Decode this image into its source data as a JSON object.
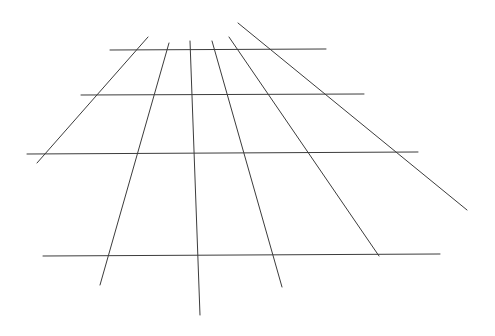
{
  "diagram": {
    "stroke_color": "#3c3c3c",
    "background": "#ffffff",
    "horizontal_lines": [
      {
        "x1": 110,
        "y1": 50,
        "x2": 326,
        "y2": 49
      },
      {
        "x1": 81,
        "y1": 95,
        "x2": 364,
        "y2": 94
      },
      {
        "x1": 27,
        "y1": 154,
        "x2": 418,
        "y2": 152
      },
      {
        "x1": 43,
        "y1": 256,
        "x2": 440,
        "y2": 254
      }
    ],
    "converging_lines": [
      {
        "x1": 148,
        "y1": 37,
        "x2": 37,
        "y2": 163
      },
      {
        "x1": 169,
        "y1": 43,
        "x2": 100,
        "y2": 285
      },
      {
        "x1": 190,
        "y1": 41,
        "x2": 200,
        "y2": 315
      },
      {
        "x1": 212,
        "y1": 41,
        "x2": 282,
        "y2": 287
      },
      {
        "x1": 229,
        "y1": 37,
        "x2": 379,
        "y2": 256
      },
      {
        "x1": 238,
        "y1": 23,
        "x2": 467,
        "y2": 210
      }
    ]
  }
}
